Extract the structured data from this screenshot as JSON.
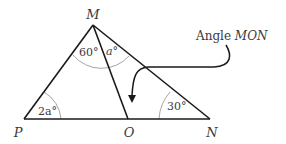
{
  "diagram": {
    "vertices": {
      "M": {
        "label": "M"
      },
      "P": {
        "label": "P"
      },
      "O": {
        "label": "O"
      },
      "N": {
        "label": "N"
      }
    },
    "angles": {
      "angle_at_P": "2a°",
      "angle_PMO": "60°",
      "angle_OMN": "a°",
      "angle_at_N": "30°"
    },
    "annotation": {
      "prefix": "Angle ",
      "name": "MON"
    },
    "colors": {
      "line": "#1a1a1a",
      "arc": "#9a9a9a",
      "text": "#3a3a3a",
      "background": "#ffffff"
    }
  }
}
